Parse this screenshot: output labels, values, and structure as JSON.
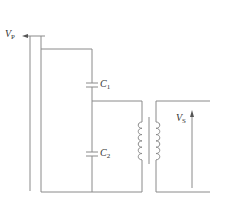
{
  "diagram": {
    "type": "capacitive voltage transformer circuit",
    "labels": {
      "vp": {
        "main": "V",
        "sub": "P"
      },
      "c1": {
        "main": "C",
        "sub": "1"
      },
      "c2": {
        "main": "C",
        "sub": "2"
      },
      "vs": {
        "main": "V",
        "sub": "S"
      }
    },
    "colors": {
      "wire": "#8a8a8a",
      "text": "#333333",
      "background": "#ffffff"
    }
  }
}
